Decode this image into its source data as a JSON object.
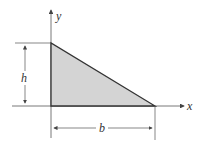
{
  "diagram": {
    "shape": "right triangle",
    "fill_color": "#d4d4d4",
    "stroke_color": "#333333",
    "axes": {
      "x_label": "x",
      "y_label": "y"
    },
    "dimensions": {
      "height_label": "h",
      "base_label": "b"
    }
  }
}
